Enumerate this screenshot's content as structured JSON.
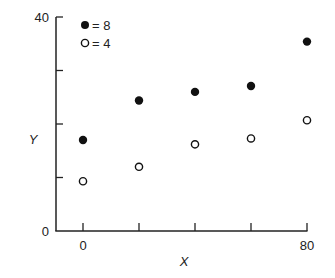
{
  "chart_data": {
    "type": "scatter",
    "title": "",
    "xlabel": "X",
    "ylabel": "Y",
    "xlim": [
      0,
      80
    ],
    "ylim": [
      0,
      40
    ],
    "x_ticks": [
      0,
      20,
      40,
      60,
      80
    ],
    "x_tick_labels": [
      "0",
      "",
      "",
      "",
      "80"
    ],
    "y_ticks": [
      0,
      10,
      20,
      30,
      40
    ],
    "y_tick_labels": [
      "0",
      "",
      "",
      "",
      "40"
    ],
    "grid": false,
    "legend_position": "upper left",
    "x": [
      0,
      20,
      40,
      60,
      80
    ],
    "series": [
      {
        "name": "= 8",
        "marker": "filled-circle",
        "values": [
          17,
          24.4,
          26,
          27.1,
          35.4
        ]
      },
      {
        "name": "= 4",
        "marker": "open-circle",
        "values": [
          9.3,
          12,
          16.2,
          17.3,
          20.7
        ]
      }
    ]
  },
  "labels": {
    "x_axis": "X",
    "y_axis": "Y",
    "y_min": "0",
    "y_max": "40",
    "x_min": "0",
    "x_max": "80",
    "legend_filled": "= 8",
    "legend_open": "= 4"
  }
}
